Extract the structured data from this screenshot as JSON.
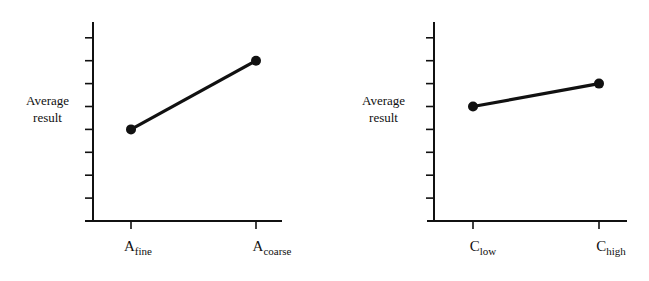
{
  "chart_data": [
    {
      "type": "line",
      "title": "",
      "xlabel": "",
      "ylabel": "Average result",
      "categories": [
        "A_fine",
        "A_coarse"
      ],
      "category_labels": [
        {
          "base": "A",
          "sub": "fine"
        },
        {
          "base": "A",
          "sub": "coarse"
        }
      ],
      "values": [
        4,
        7
      ],
      "ylim": [
        0,
        8.5
      ],
      "y_ticks": 8,
      "y_tick_labels": [],
      "grid": false,
      "legend": null
    },
    {
      "type": "line",
      "title": "",
      "xlabel": "",
      "ylabel": "Average result",
      "categories": [
        "C_low",
        "C_high"
      ],
      "category_labels": [
        {
          "base": "C",
          "sub": "low"
        },
        {
          "base": "C",
          "sub": "high"
        }
      ],
      "values": [
        5,
        6
      ],
      "ylim": [
        0,
        8.5
      ],
      "y_ticks": 8,
      "y_tick_labels": [],
      "grid": false,
      "legend": null
    }
  ],
  "panels": [
    {
      "ylabel_line1": "Average",
      "ylabel_line2": "result",
      "x0_base": "A",
      "x0_sub": "fine",
      "x1_base": "A",
      "x1_sub": "coarse"
    },
    {
      "ylabel_line1": "Average",
      "ylabel_line2": "result",
      "x0_base": "C",
      "x0_sub": "low",
      "x1_base": "C",
      "x1_sub": "high"
    }
  ]
}
